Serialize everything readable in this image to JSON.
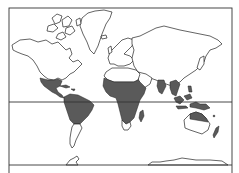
{
  "map": {
    "projection": "mercator-world",
    "frame": {
      "left": 9,
      "top": 8,
      "right": 232,
      "bottom": 173
    },
    "equator_y": 102,
    "lower_line_y": 165,
    "colors": {
      "background": "#ffffff",
      "outline": "#222222",
      "shaded_region": "#5a5a5a"
    },
    "shaded_regions": [
      "Southern Mexico / Central America",
      "Caribbean islands",
      "Northern South America (Amazon basin)",
      "Central Africa (Sahel to southern Africa)",
      "Madagascar (east coast)",
      "Southern India / Sri Lanka",
      "Southeast Asia mainland",
      "Maritime Southeast Asia / Indonesia / New Guinea",
      "Northern Australia",
      "Pacific islands / New Zealand (north)"
    ],
    "lines": [
      {
        "name": "equator",
        "label": ""
      },
      {
        "name": "southern-boundary",
        "label": ""
      }
    ]
  }
}
